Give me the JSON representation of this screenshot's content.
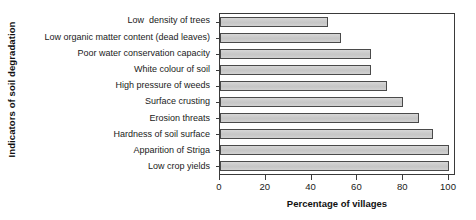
{
  "chart_data": {
    "type": "bar",
    "orientation": "horizontal",
    "title": "",
    "xlabel": "Percentage of villages",
    "ylabel": "Indicators of soil degradation",
    "categories": [
      "Low  density of trees",
      "Low organic matter content (dead leaves)",
      "Poor water conservation capacity",
      "White colour of soil",
      "High pressure of weeds",
      "Surface crusting",
      "Erosion threats",
      "Hardness of soil surface",
      "Apparition of Striga",
      "Low crop yields"
    ],
    "values": [
      47,
      53,
      66,
      66,
      73,
      80,
      87,
      93,
      100,
      100
    ],
    "xlim": [
      0,
      100
    ],
    "xticks": [
      0,
      20,
      40,
      60,
      80,
      100
    ],
    "xticklabels": [
      "0",
      "20",
      "40",
      "60",
      "80",
      "100"
    ],
    "grid": false,
    "legend": null,
    "bar_fill_color": "#cccccc",
    "bar_edge_color": "#4a4a4a",
    "frame_color": "#3a3a3a",
    "background_color": "#ffffff"
  }
}
